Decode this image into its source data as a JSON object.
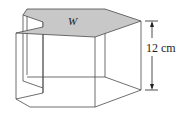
{
  "diagram": {
    "type": "prism-with-notched-top",
    "top_face_label": "W",
    "height_label": "12 cm",
    "colors": {
      "top_face_fill": "#c8c8c8",
      "edge_stroke": "#4a4a4a",
      "background": "#ffffff"
    }
  }
}
